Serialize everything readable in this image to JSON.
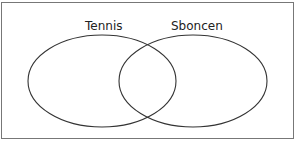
{
  "diagram": {
    "type": "venn",
    "sets": [
      {
        "label": "Tennis",
        "color": "#333333"
      },
      {
        "label": "Sboncen",
        "color": "#333333"
      }
    ],
    "border_color": "#777777",
    "background": "#ffffff"
  }
}
